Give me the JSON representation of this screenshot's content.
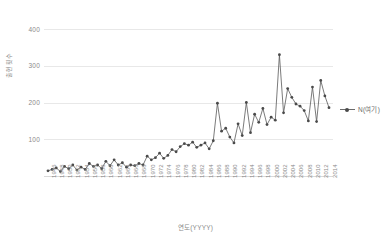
{
  "chart_data": {
    "type": "line",
    "title": "",
    "xlabel": "연도(YYYY)",
    "ylabel": "출현횟수",
    "ylim": [
      0,
      430
    ],
    "yticks": [
      100,
      200,
      300,
      400
    ],
    "grid": true,
    "legend_position": "right",
    "legend": [
      "N(여기)"
    ],
    "x_tick_step": 2,
    "x_tick_labels": [
      "1946",
      "1948",
      "1950",
      "1952",
      "1954",
      "1956",
      "1958",
      "1960",
      "1962",
      "1964",
      "1966",
      "1968",
      "1970",
      "1972",
      "1974",
      "1976",
      "1978",
      "1980",
      "1982",
      "1984",
      "1986",
      "1988",
      "1990",
      "1992",
      "1994",
      "1996",
      "1998",
      "2000",
      "2002",
      "2004",
      "2006",
      "2008",
      "2010",
      "2012",
      "2014"
    ],
    "series": [
      {
        "name": "N(여기)",
        "color": "#595959",
        "marker": "circle",
        "x": [
          1946,
          1947,
          1948,
          1949,
          1950,
          1951,
          1952,
          1953,
          1954,
          1955,
          1956,
          1957,
          1958,
          1959,
          1960,
          1961,
          1962,
          1963,
          1964,
          1965,
          1966,
          1967,
          1968,
          1969,
          1970,
          1971,
          1972,
          1973,
          1974,
          1975,
          1976,
          1977,
          1978,
          1979,
          1980,
          1981,
          1982,
          1983,
          1984,
          1985,
          1986,
          1987,
          1988,
          1989,
          1990,
          1991,
          1992,
          1993,
          1994,
          1995,
          1996,
          1997,
          1998,
          1999,
          2000,
          2001,
          2002,
          2003,
          2004,
          2005,
          2006,
          2007,
          2008,
          2009,
          2010,
          2011,
          2012,
          2013,
          2014
        ],
        "values": [
          14,
          18,
          22,
          12,
          26,
          20,
          30,
          16,
          24,
          18,
          34,
          26,
          30,
          20,
          40,
          28,
          44,
          30,
          36,
          24,
          30,
          28,
          34,
          30,
          54,
          44,
          50,
          62,
          48,
          56,
          72,
          66,
          80,
          88,
          84,
          92,
          78,
          84,
          90,
          74,
          96,
          198,
          122,
          130,
          106,
          90,
          142,
          110,
          200,
          118,
          168,
          146,
          184,
          140,
          160,
          152,
          330,
          172,
          238,
          214,
          196,
          190,
          178,
          150,
          242,
          148,
          260,
          218,
          186
        ]
      }
    ]
  }
}
